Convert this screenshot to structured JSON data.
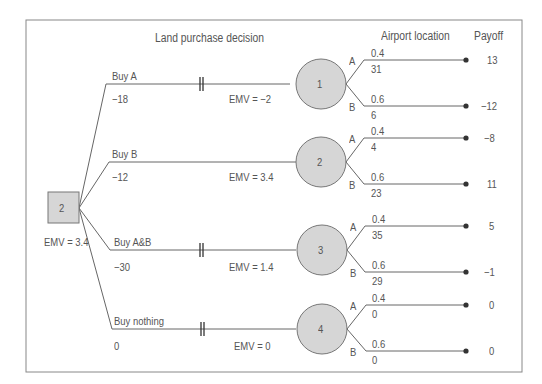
{
  "diagram": {
    "type": "decision_tree",
    "headers": {
      "decision": "Land purchase decision",
      "chance": "Airport location",
      "payoff": "Payoff"
    },
    "root": {
      "label": "2",
      "emv": "EMV = 3.4"
    },
    "branches": [
      {
        "name": "Buy A",
        "cost": "−18",
        "emv": "EMV = −2",
        "node": "1",
        "pruned": true,
        "outcomes": [
          {
            "label": "A",
            "prob": "0.4",
            "value": "31",
            "payoff": "13"
          },
          {
            "label": "B",
            "prob": "0.6",
            "value": "6",
            "payoff": "−12"
          }
        ]
      },
      {
        "name": "Buy B",
        "cost": "−12",
        "emv": "EMV = 3.4",
        "node": "2",
        "pruned": false,
        "outcomes": [
          {
            "label": "A",
            "prob": "0.4",
            "value": "4",
            "payoff": "−8"
          },
          {
            "label": "B",
            "prob": "0.6",
            "value": "23",
            "payoff": "11"
          }
        ]
      },
      {
        "name": "Buy A&B",
        "cost": "−30",
        "emv": "EMV = 1.4",
        "node": "3",
        "pruned": true,
        "outcomes": [
          {
            "label": "A",
            "prob": "0.4",
            "value": "35",
            "payoff": "5"
          },
          {
            "label": "B",
            "prob": "0.6",
            "value": "29",
            "payoff": "−1"
          }
        ]
      },
      {
        "name": "Buy nothing",
        "cost": "0",
        "emv": "EMV = 0",
        "node": "4",
        "pruned": true,
        "outcomes": [
          {
            "label": "A",
            "prob": "0.4",
            "value": "0",
            "payoff": "0"
          },
          {
            "label": "B",
            "prob": "0.6",
            "value": "0",
            "payoff": "0"
          }
        ]
      }
    ],
    "colors": {
      "line": "#666666",
      "node_fill": "#d6d6d6",
      "border": "#888888"
    }
  }
}
